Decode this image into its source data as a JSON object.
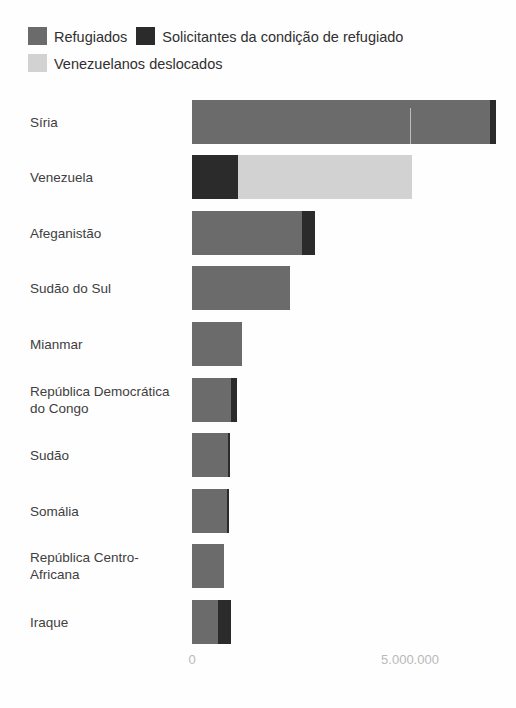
{
  "colors": {
    "refugees": "#6b6b6b",
    "asylum_seekers": "#2b2b2b",
    "venezuelans_displaced": "#d2d2d2",
    "background": "#fefefe",
    "axis_text": "#b9b9b9",
    "label_text": "#404040"
  },
  "chart_data": {
    "type": "bar",
    "orientation": "horizontal",
    "stacked": true,
    "title": "",
    "xlabel": "",
    "ylabel": "",
    "grid": false,
    "legend_position": "top-left",
    "xlim": [
      0,
      7000000
    ],
    "xticks": [
      0,
      5000000
    ],
    "xtick_labels": [
      "0",
      "5.000.000"
    ],
    "categories": [
      "Síria",
      "Venezuela",
      "Afeganistão",
      "Sudão do Sul",
      "Mianmar",
      "República Democrática do Congo",
      "Sudão",
      "Somália",
      "República Centro-Africana",
      "Iraque"
    ],
    "series": [
      {
        "name": "Refugiados",
        "color": "#6b6b6b",
        "values": [
          6830000,
          0,
          2520000,
          2250000,
          1150000,
          900000,
          820000,
          800000,
          740000,
          600000
        ]
      },
      {
        "name": "Solicitantes da condição de refugiado",
        "color": "#2b2b2b",
        "values": [
          140000,
          1050000,
          300000,
          0,
          0,
          130000,
          50000,
          40000,
          0,
          290000
        ]
      },
      {
        "name": "Venezuelanos deslocados",
        "color": "#d2d2d2",
        "values": [
          0,
          3990000,
          0,
          0,
          0,
          0,
          0,
          0,
          0,
          0
        ]
      }
    ]
  },
  "legend": {
    "items": [
      {
        "label": "Refugiados",
        "color_key": "refugees"
      },
      {
        "label": "Solicitantes da condição de refugiado",
        "color_key": "asylum_seekers"
      },
      {
        "label": "Venezuelanos deslocados",
        "color_key": "venezuelans_displaced"
      }
    ]
  }
}
